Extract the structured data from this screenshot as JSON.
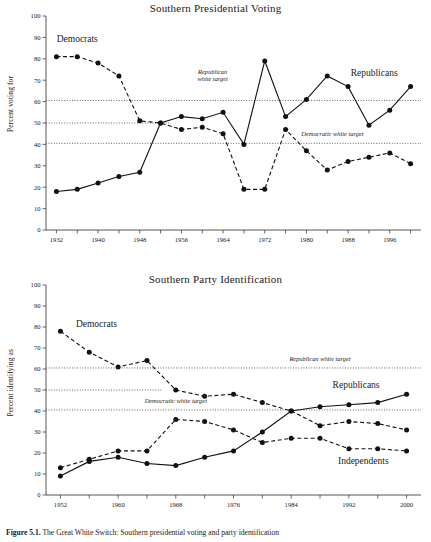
{
  "figure": {
    "caption_prefix": "Figure 5.1.",
    "caption_text": "The Great White Switch: Southern presidential voting and party identification"
  },
  "chart_data": [
    {
      "type": "line",
      "id": "southern-presidential-voting",
      "title": "Southern Presidential Voting",
      "xlabel": "",
      "ylabel": "Percent voting for",
      "ylim": [
        0,
        100
      ],
      "ytick_step": 10,
      "yticks": [
        0,
        10,
        20,
        30,
        40,
        50,
        60,
        70,
        80,
        90,
        100
      ],
      "xlim": [
        1930,
        2002
      ],
      "xticks": [
        1932,
        1936,
        1940,
        1944,
        1948,
        1952,
        1956,
        1960,
        1964,
        1968,
        1972,
        1976,
        1980,
        1984,
        1988,
        1992,
        1996,
        2000
      ],
      "xtick_labels": [
        "1932",
        "",
        "1940",
        "",
        "1948",
        "",
        "1956",
        "",
        "1964",
        "",
        "1972",
        "",
        "1980",
        "",
        "1988",
        "",
        "1996",
        ""
      ],
      "grid": false,
      "legend_position": "inline-annotations",
      "x": [
        1932,
        1936,
        1940,
        1944,
        1948,
        1952,
        1956,
        1960,
        1964,
        1968,
        1972,
        1976,
        1980,
        1984,
        1988,
        1992,
        1996,
        2000
      ],
      "series": [
        {
          "name": "Democrats",
          "style": "dashed",
          "label_x": 1936,
          "label_y": 88,
          "values": [
            81,
            81,
            78,
            72,
            51,
            50,
            47,
            48,
            45,
            19,
            19,
            47,
            37,
            28,
            32,
            34,
            36,
            31
          ]
        },
        {
          "name": "Republicans",
          "style": "solid",
          "label_x": 1993,
          "label_y": 72,
          "values": [
            18,
            19,
            22,
            25,
            27,
            50,
            53,
            52,
            55,
            40,
            79,
            53,
            61,
            72,
            67,
            49,
            56,
            67
          ]
        }
      ],
      "annotations": [
        {
          "name": "republican-white-target",
          "text_lines": [
            "Republican",
            "white target"
          ],
          "value": 60.5,
          "label_x": 1962,
          "label_y": 73
        },
        {
          "name": "democratic-white-target",
          "text_lines": [
            "Democratic white target"
          ],
          "value": 40.5,
          "label_x": 1985,
          "label_y": 44
        },
        {
          "name": "fifty-percent-line",
          "text_lines": [],
          "value": 50,
          "x_start": 1930,
          "x_end": 1954
        }
      ]
    },
    {
      "type": "line",
      "id": "southern-party-identification",
      "title": "Southern Party Identification",
      "xlabel": "",
      "ylabel": "Percent identifying as",
      "ylim": [
        0,
        100
      ],
      "ytick_step": 10,
      "yticks": [
        0,
        10,
        20,
        30,
        40,
        50,
        60,
        70,
        80,
        90,
        100
      ],
      "xlim": [
        1950,
        2002
      ],
      "xticks": [
        1952,
        1956,
        1960,
        1964,
        1968,
        1972,
        1976,
        1980,
        1984,
        1988,
        1992,
        1996,
        2000
      ],
      "xtick_labels": [
        "1952",
        "",
        "1960",
        "",
        "1968",
        "",
        "1976",
        "",
        "1984",
        "",
        "1992",
        "",
        "2000"
      ],
      "grid": false,
      "legend_position": "inline-annotations",
      "x": [
        1952,
        1956,
        1960,
        1964,
        1968,
        1972,
        1976,
        1980,
        1984,
        1988,
        1992,
        1996,
        2000
      ],
      "series": [
        {
          "name": "Democrats",
          "style": "dashed",
          "label_x": 1957,
          "label_y": 80,
          "values": [
            78,
            68,
            61,
            64,
            50,
            47,
            48,
            44,
            40,
            33,
            35,
            34,
            31
          ]
        },
        {
          "name": "Republicans",
          "style": "solid",
          "label_x": 1993,
          "label_y": 51,
          "values": [
            9,
            16,
            18,
            15,
            14,
            18,
            21,
            30,
            40,
            42,
            43,
            44,
            48
          ]
        },
        {
          "name": "Independents",
          "style": "dashed",
          "label_x": 1994,
          "label_y": 15,
          "values": [
            13,
            17,
            21,
            21,
            36,
            35,
            31,
            25,
            27,
            27,
            22,
            22,
            21
          ]
        }
      ],
      "annotations": [
        {
          "name": "republican-white-target",
          "text_lines": [
            "Republican white target"
          ],
          "value": 60.5,
          "label_x": 1988,
          "label_y": 64
        },
        {
          "name": "democratic-white-target",
          "text_lines": [
            "Democratic white target"
          ],
          "value": 40.5,
          "label_x": 1968,
          "label_y": 44
        },
        {
          "name": "fifty-percent-line",
          "text_lines": [],
          "value": 50,
          "x_start": 1950,
          "x_end": 1966
        }
      ]
    }
  ]
}
